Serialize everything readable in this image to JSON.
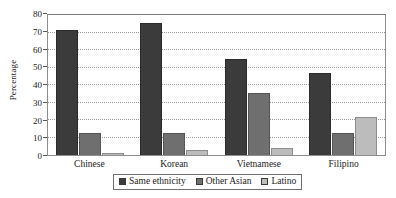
{
  "chart_data": {
    "type": "bar",
    "title": "",
    "subtitle": "",
    "xlabel": "",
    "ylabel": "Percentage",
    "ylim": [
      0,
      80
    ],
    "yticks": [
      0,
      10,
      20,
      30,
      40,
      50,
      60,
      70,
      80
    ],
    "ytick_labels": [
      "0",
      "10",
      "20",
      "30",
      "40",
      "50",
      "60",
      "70",
      "80"
    ],
    "grid": true,
    "grid_axis": "y",
    "legend_position": "bottom-center",
    "categories": [
      "Chinese",
      "Korean",
      "Vietnamese",
      "Filipino"
    ],
    "series": [
      {
        "name": "Same ethnicity",
        "color": "#3b3b3b",
        "values": [
          70.2,
          74.5,
          54.0,
          46.0
        ]
      },
      {
        "name": "Other Asian",
        "color": "#6f6f6f",
        "values": [
          12.2,
          12.6,
          35.0,
          12.2
        ]
      },
      {
        "name": "Latino",
        "color": "#bcbcbc",
        "values": [
          1.3,
          2.6,
          4.0,
          21.4
        ]
      }
    ],
    "annotations": []
  },
  "axes": {
    "y_title": "Percentage"
  },
  "legend": {
    "entries": [
      {
        "label": "Same ethnicity",
        "color": "#3b3b3b"
      },
      {
        "label": "Other Asian",
        "color": "#6f6f6f"
      },
      {
        "label": "Latino",
        "color": "#bcbcbc"
      }
    ]
  }
}
